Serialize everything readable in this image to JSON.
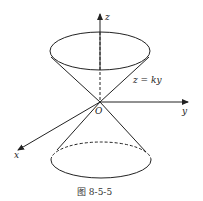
{
  "diagram": {
    "axes": {
      "z_label": "z",
      "y_label": "y",
      "x_label": "x",
      "origin_label": "O"
    },
    "surface_label": "z = ky",
    "caption": "图 8-5-5",
    "colors": {
      "stroke": "#222222",
      "background": "#ffffff"
    }
  }
}
